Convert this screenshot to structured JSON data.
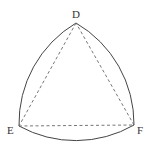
{
  "diagram": {
    "vertices": [
      {
        "label": "D",
        "x": 76,
        "y": 23
      },
      {
        "label": "E",
        "x": 19,
        "y": 126
      },
      {
        "label": "F",
        "x": 134,
        "y": 125
      }
    ],
    "colors": {
      "stroke": "#444444",
      "dash": "#666666"
    }
  },
  "labels": {
    "d": "D",
    "e": "E",
    "f": "F"
  }
}
